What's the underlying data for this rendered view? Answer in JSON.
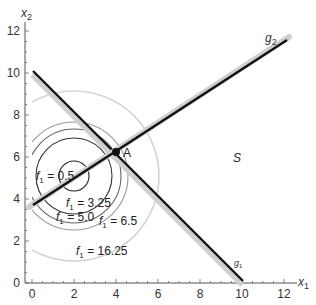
{
  "axes": {
    "x_label": "x",
    "x_sub": "1",
    "y_label": "x",
    "y_sub": "2",
    "x_ticks": [
      "0",
      "2",
      "4",
      "6",
      "8",
      "10",
      "12"
    ],
    "y_ticks": [
      "0",
      "2",
      "4",
      "6",
      "8",
      "10",
      "12"
    ]
  },
  "lines": {
    "g1": {
      "name": "g",
      "sub": "1",
      "from": [
        0,
        10
      ],
      "to": [
        10,
        0
      ]
    },
    "g2": {
      "name": "g",
      "sub": "2",
      "from": [
        0,
        3.333
      ],
      "to": [
        12.1,
        11.4
      ]
    }
  },
  "point": {
    "label": "A",
    "x": 4,
    "y": 6
  },
  "region_label": "S",
  "contours": {
    "center": [
      2,
      5
    ],
    "items": [
      {
        "label_f": "f",
        "label_sub": "1",
        "label_rest": " = 0.5",
        "value": 0.5,
        "color": "#222222"
      },
      {
        "label_f": "f",
        "label_sub": "1",
        "label_rest": " = 3.25",
        "value": 3.25,
        "color": "#333333"
      },
      {
        "label_f": "f",
        "label_sub": "1",
        "label_rest": " = 5.0",
        "value": 5.0,
        "color": "#555555"
      },
      {
        "label_f": "f",
        "label_sub": "1",
        "label_rest": " = 6.5",
        "value": 6.5,
        "color": "#888888"
      },
      {
        "label_f": "f",
        "label_sub": "1",
        "label_rest": " = 16.25",
        "value": 16.25,
        "color": "#c8c8c8"
      }
    ]
  }
}
